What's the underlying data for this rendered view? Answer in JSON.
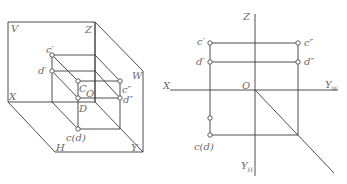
{
  "left_figure": {
    "description": "Three-plane projection system (axonometric view) with line CD perpendicular to H",
    "labels": {
      "V": "V",
      "Z": "Z",
      "X": "X",
      "H": "H",
      "Y": "Y",
      "W": "W",
      "O": "O",
      "C": "C",
      "D": "D",
      "c_prime": "c′",
      "d_prime": "d′",
      "c_dprime": "c″",
      "d_dprime": "d″",
      "cd_h": "c(d)"
    }
  },
  "right_figure": {
    "description": "Orthographic projection of line CD on three views",
    "labels": {
      "Z": "Z",
      "X": "X",
      "O": "O",
      "YW_main": "Y",
      "YW_sub": "W",
      "YH_main": "Y",
      "YH_sub": "H",
      "c_prime": "c′",
      "d_prime": "d′",
      "c_dprime": "c″",
      "d_dprime": "d″",
      "cd_h": "c(d)"
    }
  },
  "colors": {
    "line": "#3a3a3a",
    "label": "#6a6a6a",
    "background": "#ffffff"
  }
}
